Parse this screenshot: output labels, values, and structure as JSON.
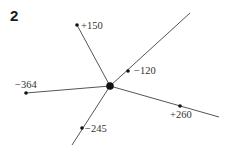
{
  "problem_number": "2",
  "diagram": {
    "center": {
      "x": 110,
      "y": 86,
      "r": 3.8
    },
    "line_color": "#555555",
    "dot_color": "#111111",
    "branches": [
      {
        "name": "branch-plus-150",
        "label": "+150",
        "dot": {
          "x": 77,
          "y": 25
        },
        "end": {
          "x": 77,
          "y": 25
        },
        "label_pos": {
          "x": 81,
          "y": 29
        }
      },
      {
        "name": "branch-minus-120",
        "label": "−120",
        "dot": {
          "x": 128,
          "y": 71
        },
        "end": {
          "x": 190,
          "y": 13
        },
        "label_pos": {
          "x": 134,
          "y": 74
        }
      },
      {
        "name": "branch-minus-364",
        "label": "−364",
        "dot": {
          "x": 26,
          "y": 93
        },
        "end": {
          "x": 26,
          "y": 93
        },
        "label_pos": {
          "x": 15,
          "y": 88
        }
      },
      {
        "name": "branch-minus-245",
        "label": "−245",
        "dot": {
          "x": 82,
          "y": 128
        },
        "end": {
          "x": 72,
          "y": 145
        },
        "label_pos": {
          "x": 85,
          "y": 132
        }
      },
      {
        "name": "branch-plus-260",
        "label": "+260",
        "dot": {
          "x": 180,
          "y": 106
        },
        "end": {
          "x": 219,
          "y": 117
        },
        "label_pos": {
          "x": 170,
          "y": 118
        }
      }
    ]
  }
}
